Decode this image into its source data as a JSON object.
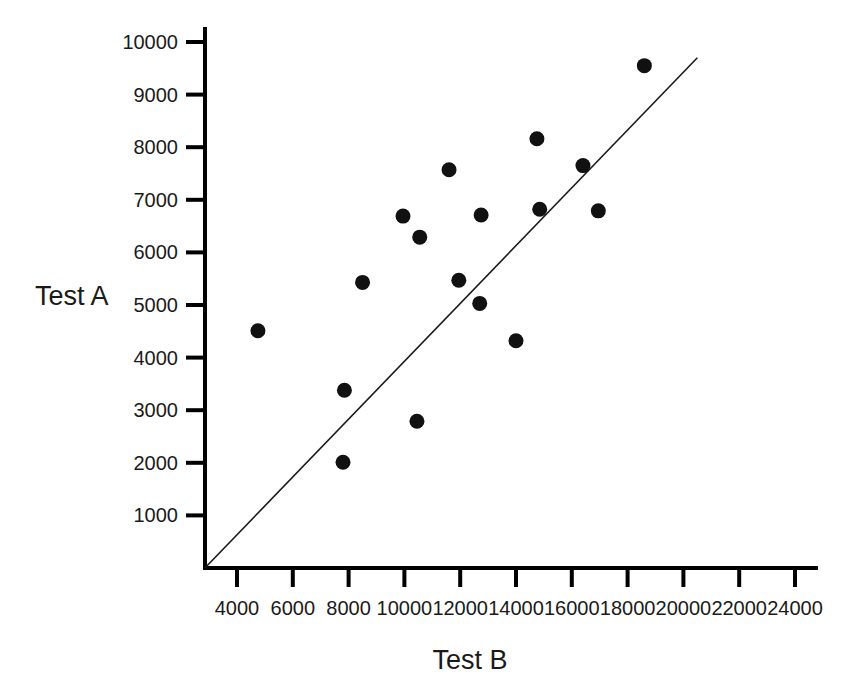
{
  "chart_data": {
    "type": "scatter",
    "title": "",
    "xlabel": "Test B",
    "ylabel": "Test A",
    "xlim": [
      2000,
      25000
    ],
    "ylim": [
      0,
      10400
    ],
    "grid": false,
    "legend": "none",
    "xticks": [
      4000,
      6000,
      8000,
      10000,
      12000,
      14000,
      16000,
      18000,
      20000,
      22000,
      24000
    ],
    "xtick_labels": [
      "4000",
      "6000",
      "8000",
      "10000",
      "12000",
      "14000",
      "16000",
      "18000",
      "20000",
      "22000",
      "24000"
    ],
    "yticks": [
      1000,
      2000,
      3000,
      4000,
      5000,
      6000,
      7000,
      8000,
      9000,
      10000
    ],
    "ytick_labels": [
      "1000",
      "2000",
      "3000",
      "4000",
      "5000",
      "6000",
      "7000",
      "8000",
      "9000",
      "10000"
    ],
    "series": [
      {
        "name": "samples",
        "marker": "circle",
        "color": "#111111",
        "points": [
          {
            "x": 4750,
            "y": 4510
          },
          {
            "x": 7800,
            "y": 2010
          },
          {
            "x": 7850,
            "y": 3380
          },
          {
            "x": 8500,
            "y": 5430
          },
          {
            "x": 9950,
            "y": 6690
          },
          {
            "x": 10450,
            "y": 2790
          },
          {
            "x": 10550,
            "y": 6290
          },
          {
            "x": 11600,
            "y": 7570
          },
          {
            "x": 11950,
            "y": 5470
          },
          {
            "x": 12700,
            "y": 5030
          },
          {
            "x": 12750,
            "y": 6710
          },
          {
            "x": 14000,
            "y": 4320
          },
          {
            "x": 14750,
            "y": 8160
          },
          {
            "x": 14850,
            "y": 6820
          },
          {
            "x": 16400,
            "y": 7650
          },
          {
            "x": 16950,
            "y": 6790
          },
          {
            "x": 18600,
            "y": 9550
          }
        ]
      }
    ],
    "reference_line": {
      "name": "identity-line",
      "description": "straight line through origin",
      "x_start": 2850,
      "y_start": 0,
      "x_end": 20500,
      "y_end": 9700,
      "color": "#1a1a1a"
    }
  },
  "axes": {
    "y_title": "Test A",
    "x_title": "Test B"
  }
}
